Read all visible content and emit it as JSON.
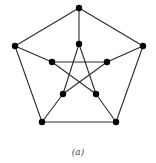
{
  "figure": {
    "caption": "(a)",
    "graph_name": "Petersen graph",
    "colors": {
      "edge": "#2a2a2a",
      "node": "#000000",
      "background": "#ffffff"
    },
    "nodes": [
      {
        "id": "o0",
        "x": 79,
        "y": 8
      },
      {
        "id": "o1",
        "x": 143,
        "y": 46
      },
      {
        "id": "o2",
        "x": 116,
        "y": 122
      },
      {
        "id": "o3",
        "x": 42,
        "y": 122
      },
      {
        "id": "o4",
        "x": 15,
        "y": 46
      },
      {
        "id": "i0",
        "x": 79,
        "y": 44
      },
      {
        "id": "i1",
        "x": 107,
        "y": 62
      },
      {
        "id": "i2",
        "x": 96,
        "y": 94
      },
      {
        "id": "i3",
        "x": 63,
        "y": 94
      },
      {
        "id": "i4",
        "x": 52,
        "y": 62
      }
    ],
    "edges": [
      [
        "o0",
        "o1"
      ],
      [
        "o1",
        "o2"
      ],
      [
        "o2",
        "o3"
      ],
      [
        "o3",
        "o4"
      ],
      [
        "o4",
        "o0"
      ],
      [
        "o0",
        "i0"
      ],
      [
        "o1",
        "i1"
      ],
      [
        "o2",
        "i2"
      ],
      [
        "o3",
        "i3"
      ],
      [
        "o4",
        "i4"
      ],
      [
        "i0",
        "i2"
      ],
      [
        "i2",
        "i4"
      ],
      [
        "i4",
        "i1"
      ],
      [
        "i1",
        "i3"
      ],
      [
        "i3",
        "i0"
      ]
    ]
  }
}
